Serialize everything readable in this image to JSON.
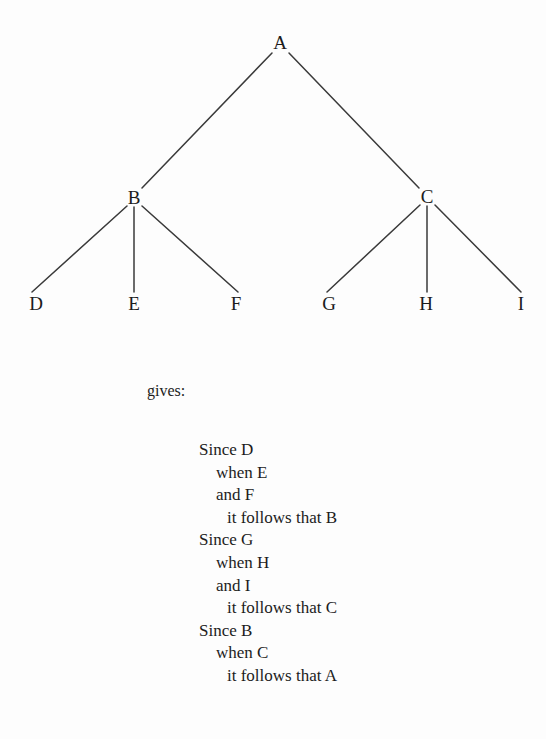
{
  "figure": {
    "nodes": [
      {
        "id": "A",
        "label": "A",
        "x": 280,
        "y": 42
      },
      {
        "id": "B",
        "label": "B",
        "x": 134,
        "y": 197
      },
      {
        "id": "C",
        "label": "C",
        "x": 427,
        "y": 196
      },
      {
        "id": "D",
        "label": "D",
        "x": 36,
        "y": 303
      },
      {
        "id": "E",
        "label": "E",
        "x": 134,
        "y": 303
      },
      {
        "id": "F",
        "label": "F",
        "x": 236,
        "y": 303
      },
      {
        "id": "G",
        "label": "G",
        "x": 329,
        "y": 303
      },
      {
        "id": "H",
        "label": "H",
        "x": 426,
        "y": 303
      },
      {
        "id": "I",
        "label": "I",
        "x": 521,
        "y": 303
      }
    ],
    "edges": [
      {
        "from": "A",
        "to": "B",
        "x1": 272,
        "y1": 53,
        "x2": 142,
        "y2": 188
      },
      {
        "from": "A",
        "to": "C",
        "x1": 289,
        "y1": 53,
        "x2": 419,
        "y2": 188
      },
      {
        "from": "B",
        "to": "D",
        "x1": 127,
        "y1": 206,
        "x2": 32,
        "y2": 292
      },
      {
        "from": "B",
        "to": "E",
        "x1": 134,
        "y1": 207,
        "x2": 134,
        "y2": 292
      },
      {
        "from": "B",
        "to": "F",
        "x1": 142,
        "y1": 206,
        "x2": 238,
        "y2": 292
      },
      {
        "from": "C",
        "to": "G",
        "x1": 420,
        "y1": 205,
        "x2": 327,
        "y2": 292
      },
      {
        "from": "C",
        "to": "H",
        "x1": 427,
        "y1": 206,
        "x2": 427,
        "y2": 292
      },
      {
        "from": "C",
        "to": "I",
        "x1": 435,
        "y1": 205,
        "x2": 521,
        "y2": 292
      }
    ],
    "edge_color": "#3a3a3a",
    "node_color": "#1c1c1c"
  },
  "gives_label": "gives:",
  "proof": {
    "lines": [
      {
        "text": "Since D",
        "indent": 0
      },
      {
        "text": "when E",
        "indent": 1
      },
      {
        "text": "and F",
        "indent": 1
      },
      {
        "text": "it follows that B",
        "indent": 2
      },
      {
        "text": "Since G",
        "indent": 0
      },
      {
        "text": "when H",
        "indent": 1
      },
      {
        "text": "and I",
        "indent": 1
      },
      {
        "text": "it follows that C",
        "indent": 2
      },
      {
        "text": "Since B",
        "indent": 0
      },
      {
        "text": "when C",
        "indent": 1
      },
      {
        "text": "it follows that A",
        "indent": 2
      }
    ]
  }
}
